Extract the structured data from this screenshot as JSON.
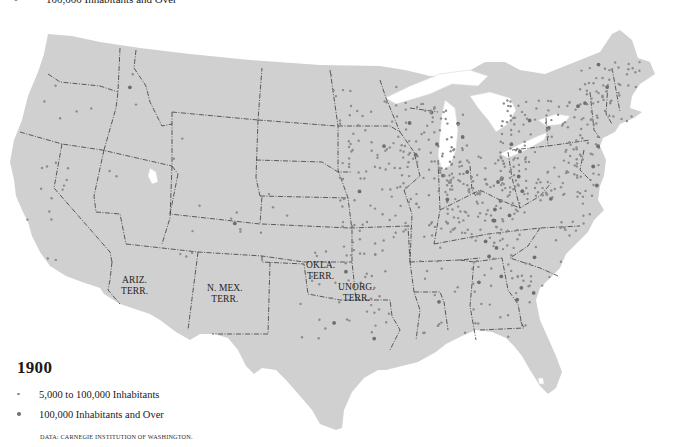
{
  "header_legend": {
    "cut_off_label": "100,000 Inhabitants and Over"
  },
  "map": {
    "year": "1900",
    "land_color": "#d0d0d0",
    "border_color": "#3a3a3a",
    "dot_color_small": "#8c8c8c",
    "dot_color_large": "#6e6e6e",
    "territory_labels": [
      {
        "id": "ariz",
        "line1": "ARIZ.",
        "line2": "TERR."
      },
      {
        "id": "nmex",
        "line1": "N. MEX.",
        "line2": "TERR."
      },
      {
        "id": "okla",
        "line1": "OKLA.",
        "line2": "TERR."
      },
      {
        "id": "unorg",
        "line1": "UNORG.",
        "line2": "TERR."
      }
    ]
  },
  "legend": {
    "title": "1900",
    "items": [
      {
        "symbol": "small-dot-icon",
        "label": "5,000 to 100,000 Inhabitants"
      },
      {
        "symbol": "large-dot-icon",
        "label": "100,000 Inhabitants and Over"
      }
    ]
  },
  "source": "DATA: CARNEGIE INSTITUTION OF WASHINGTON."
}
